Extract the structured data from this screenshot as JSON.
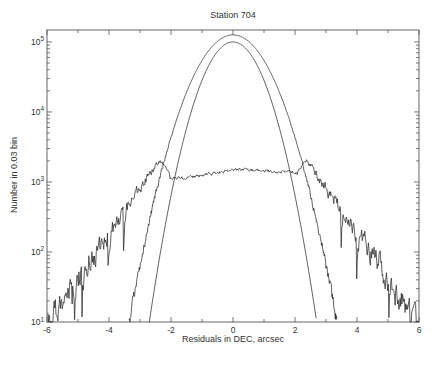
{
  "chart_data": {
    "type": "line",
    "title": "Station 704",
    "xlabel": "Residuals in DEC, arcsec",
    "ylabel": "Number in 0.03 bin",
    "grid": false,
    "legend": null,
    "x_axis": {
      "min": -6,
      "max": 6,
      "major_ticks": [
        -6,
        -4,
        -2,
        0,
        2,
        4,
        6
      ],
      "tick_labels": [
        "-6",
        "-4",
        "-2",
        "0",
        "2",
        "4",
        "6"
      ],
      "minor_ticks": [
        -5,
        -3,
        -1,
        1,
        3,
        5
      ]
    },
    "y_axis": {
      "scale": "log",
      "min": 10,
      "max": 148000,
      "decade_exponents": [
        1,
        2,
        3,
        4,
        5
      ],
      "tick_labels": [
        "10^1",
        "10^2",
        "10^3",
        "10^4",
        "10^5"
      ]
    },
    "colors": {
      "axis": "#555555",
      "text": "#333333",
      "line": "#2b2b2b"
    },
    "series": [
      {
        "name": "residuals-histogram",
        "style": "noisy-line",
        "shape": "gaussian-core",
        "peak_count": 126000,
        "center": 0,
        "count_10_at_abs_x": 3.35,
        "noise_onset_log": 4.2
      },
      {
        "name": "gaussian-fit",
        "style": "smooth-line",
        "shape": "gaussian",
        "peak_count": 100000,
        "center": 0,
        "count_10_at_abs_x": 2.7
      },
      {
        "name": "broad-noise-floor",
        "style": "noisy-line",
        "shape": "flat-core-heavy-tails",
        "core_count": 1320,
        "core_halfwidth": 2.05,
        "shoulder_count": 1950,
        "shoulder_abs_x": 2.42,
        "tail_count_10_at_abs_x": 5.97
      }
    ]
  }
}
